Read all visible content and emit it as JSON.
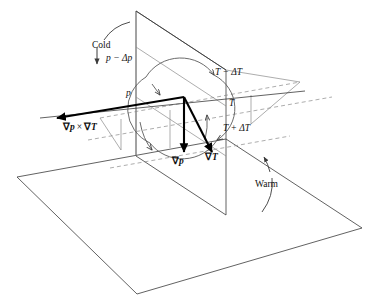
{
  "figure": {
    "background_color": "#ffffff",
    "line_color": "#3a3a3a",
    "vector_color": "#000000",
    "dashed_color": "#8a8a8a"
  },
  "labels": {
    "cold": "Cold",
    "warm": "Warm",
    "pressure_upper": "p − Δp",
    "pressure_lower": "p",
    "temp_minus": "T − ΔT",
    "temp_mid": "T",
    "temp_plus": "T + ΔT"
  },
  "vectors": [
    {
      "name": "cross-product",
      "nabla_first": "∇",
      "sub_first": "p",
      "operator": "×",
      "nabla_second": "∇",
      "sub_second": "T",
      "text": "∇p × ∇T",
      "direction": "left-down-out-of-plane"
    },
    {
      "name": "grad-p",
      "nabla": "∇",
      "sub": "p",
      "text": "∇p",
      "direction": "down"
    },
    {
      "name": "grad-T",
      "nabla": "∇",
      "sub": "T",
      "text": "∇T",
      "direction": "down-right"
    }
  ],
  "surfaces": {
    "horizontal_plane": "isobaric-surface",
    "vertical_plane": "isothermal-surface"
  },
  "annotations": {
    "rotation": "circulation-ellipse",
    "cold_arrow": "downward",
    "warm_arrow": "upward"
  }
}
